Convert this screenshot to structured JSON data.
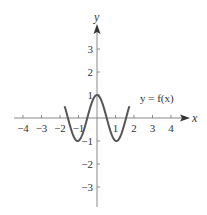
{
  "chart_data": {
    "type": "line",
    "title": "",
    "xlabel": "x",
    "ylabel": "y",
    "curve_label": "y = f(x)",
    "xlim": [
      -4.5,
      4.5
    ],
    "ylim": [
      -3.8,
      4
    ],
    "x_ticks": [
      -4,
      -3,
      -2,
      -1,
      1,
      2,
      3,
      4
    ],
    "x_tick_labels": [
      "−4",
      "−3",
      "−2",
      "−1",
      "1",
      "2",
      "3",
      "4"
    ],
    "y_ticks": [
      3,
      2,
      1,
      -1,
      -2,
      -3
    ],
    "y_tick_labels": [
      "3",
      "2",
      "1",
      "−1",
      "−2",
      "−3"
    ],
    "grid": false,
    "series": [
      {
        "name": "y = f(x)",
        "description": "approximately cos(3x) on [-1.75, 1.75]",
        "x": [
          -1.75,
          -1.5,
          -1.25,
          -1.05,
          -0.75,
          -0.5,
          -0.25,
          0,
          0.25,
          0.5,
          0.75,
          1.05,
          1.25,
          1.5,
          1.75
        ],
        "y": [
          0.9,
          0.2,
          -0.8,
          -1.0,
          -0.6,
          0.07,
          0.73,
          1.0,
          0.73,
          0.07,
          -0.6,
          -1.0,
          -0.8,
          0.2,
          0.9
        ]
      }
    ],
    "colors": {
      "axis": "#888888",
      "curve": "#555555",
      "text": "#333333"
    }
  }
}
